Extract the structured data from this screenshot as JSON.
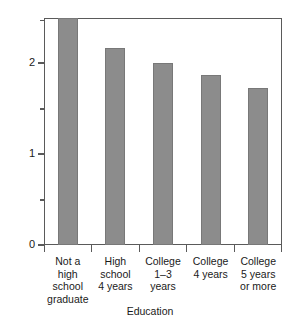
{
  "chart_data": {
    "type": "bar",
    "title": "",
    "subtitle": "",
    "xlabel": "Education",
    "ylabel": "Lifetime births expected per woman",
    "categories": [
      "Not a\nhigh\nschool\ngraduate",
      "High\nschool\n4 years",
      "College\n1–3\nyears",
      "College\n4 years",
      "College\n5 years\nor more"
    ],
    "values": [
      2.49,
      2.16,
      2.0,
      1.87,
      1.73
    ],
    "ylim": [
      0,
      2.5
    ],
    "ytick_values": [
      0,
      1,
      2
    ],
    "ytick_labels": [
      "0",
      "1",
      "2"
    ],
    "yminor_ticks": [
      0.5,
      1.5,
      2.5
    ],
    "grid": false,
    "legend": null,
    "bar_color": "#8c8c8c",
    "bar_edge_color": "#787878",
    "axis_color": "#5a5a5a",
    "background": "#ffffff"
  }
}
